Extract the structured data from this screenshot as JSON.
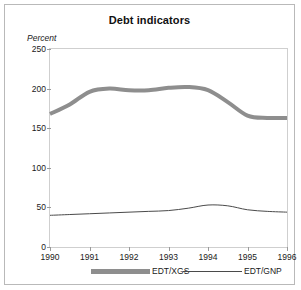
{
  "figure": {
    "title": "Debt indicators",
    "ylabel": "Percent"
  },
  "legend": {
    "items": [
      {
        "label": "EDT/XGS",
        "style": "thick",
        "color": "#8e8e8e"
      },
      {
        "label": "EDT/GNP",
        "style": "thin",
        "color": "#4a4a4a"
      }
    ]
  },
  "chart_data": {
    "type": "line",
    "title": "Debt indicators",
    "xlabel": "",
    "ylabel": "Percent",
    "xlim": [
      1990,
      1996
    ],
    "ylim": [
      0,
      250
    ],
    "yticks": [
      0,
      50,
      100,
      150,
      200,
      250
    ],
    "xticks": [
      1990,
      1991,
      1992,
      1993,
      1994,
      1995,
      1996
    ],
    "grid": false,
    "legend_position": "below",
    "x": [
      1990,
      1990.5,
      1991,
      1991.5,
      1992,
      1992.5,
      1993,
      1993.5,
      1994,
      1994.5,
      1995,
      1995.5,
      1996
    ],
    "series": [
      {
        "name": "EDT/XGS",
        "color": "#8e8e8e",
        "width": 4,
        "values": [
          168,
          180,
          196,
          200,
          198,
          198,
          201,
          202,
          198,
          183,
          166,
          163,
          163
        ]
      },
      {
        "name": "EDT/GNP",
        "color": "#4a4a4a",
        "width": 1,
        "values": [
          40,
          41,
          42,
          43,
          44,
          45,
          46,
          49,
          53,
          52,
          47,
          45,
          44
        ]
      }
    ]
  }
}
